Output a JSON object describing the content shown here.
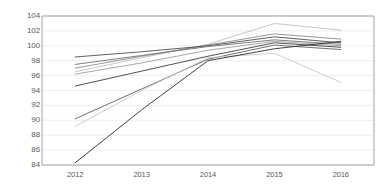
{
  "chart_data": {
    "type": "line",
    "title": "",
    "subtitle": "",
    "xlabel": "",
    "ylabel": "",
    "x": [
      "2012",
      "2013",
      "2014",
      "2015",
      "2016"
    ],
    "categories": [
      "2012",
      "2013",
      "2014",
      "2015",
      "2016"
    ],
    "ylim": [
      84,
      104
    ],
    "ytick_values": [
      104,
      102,
      100,
      98,
      96,
      94,
      92,
      90,
      88,
      86,
      84
    ],
    "ytick_labels": [
      "104",
      "102",
      "100",
      "98",
      "96",
      "94",
      "92",
      "90",
      "88",
      "86",
      "84"
    ],
    "xtick_labels": [
      "2012",
      "2013",
      "2014",
      "2015",
      "2016"
    ],
    "grid": true,
    "grid_axis": "y",
    "grid_color": "#e8e8e8",
    "legend": false,
    "legend_position": "none",
    "background_color": "#ffffff",
    "border_color": "#9a9a9a",
    "series": [
      {
        "name": "Series 1",
        "color": "#bfbfbf",
        "width": 0.9,
        "values": [
          96.5,
          98.4,
          100.2,
          103.0,
          102.1
        ]
      },
      {
        "name": "Series 2",
        "color": "#8c8c8c",
        "width": 0.9,
        "values": [
          97.0,
          98.6,
          100.1,
          101.6,
          100.9
        ]
      },
      {
        "name": "Series 3",
        "color": "#4d4d4d",
        "width": 0.9,
        "values": [
          98.5,
          99.2,
          100.0,
          101.2,
          100.4
        ]
      },
      {
        "name": "Series 4",
        "color": "#707070",
        "width": 0.9,
        "values": [
          97.5,
          98.7,
          99.9,
          100.8,
          100.2
        ]
      },
      {
        "name": "Series 5",
        "color": "#9e9e9e",
        "width": 0.9,
        "values": [
          96.2,
          97.7,
          99.4,
          100.6,
          100.0
        ]
      },
      {
        "name": "Series 6",
        "color": "#3d3d3d",
        "width": 0.9,
        "values": [
          94.6,
          96.6,
          98.6,
          100.4,
          99.8
        ]
      },
      {
        "name": "Series 7",
        "color": "#606060",
        "width": 0.9,
        "values": [
          90.2,
          94.2,
          98.2,
          100.1,
          99.5
        ]
      },
      {
        "name": "Series 8",
        "color": "#c8c8c8",
        "width": 0.9,
        "values": [
          89.2,
          94.0,
          98.4,
          99.0,
          95.1
        ]
      },
      {
        "name": "Series 9",
        "color": "#2b2b2b",
        "width": 0.9,
        "values": [
          84.3,
          91.4,
          98.0,
          99.6,
          100.6
        ]
      }
    ]
  }
}
